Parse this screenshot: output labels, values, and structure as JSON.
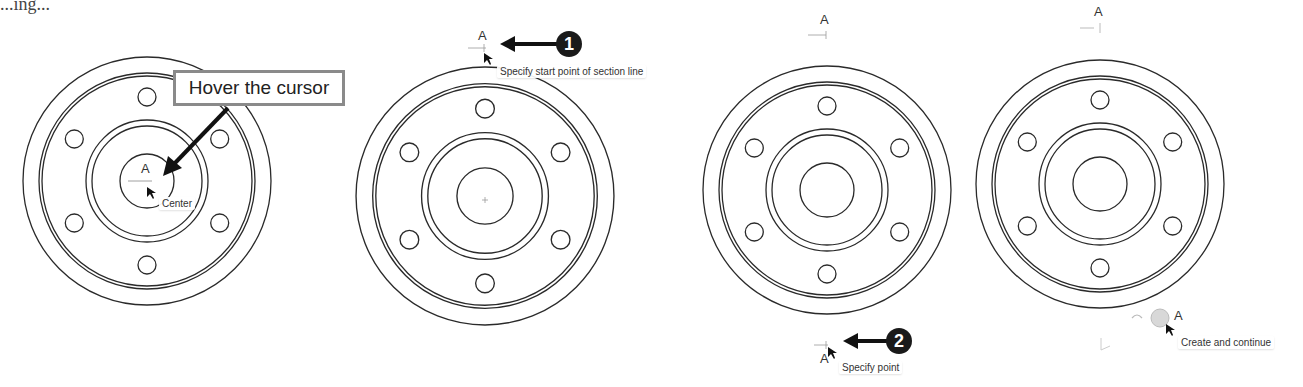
{
  "header_fragment": "...ing...",
  "panels": [
    {
      "id": "panel-1",
      "callout": "Hover the cursor",
      "section_label": "A",
      "tooltip": "Center"
    },
    {
      "id": "panel-2",
      "section_label": "A",
      "step_badge": "1",
      "tooltip": "Specify start point of section line"
    },
    {
      "id": "panel-3",
      "section_label_top": "A",
      "section_label_bottom": "A",
      "step_badge": "2",
      "tooltip": "Specify point"
    },
    {
      "id": "panel-4",
      "section_label_top": "A",
      "section_label_bottom": "A",
      "tooltip": "Create and continue"
    }
  ],
  "colors": {
    "line": "#2a2a2a",
    "badge": "#1a1a1a",
    "callout_border": "#8a8a8a"
  }
}
